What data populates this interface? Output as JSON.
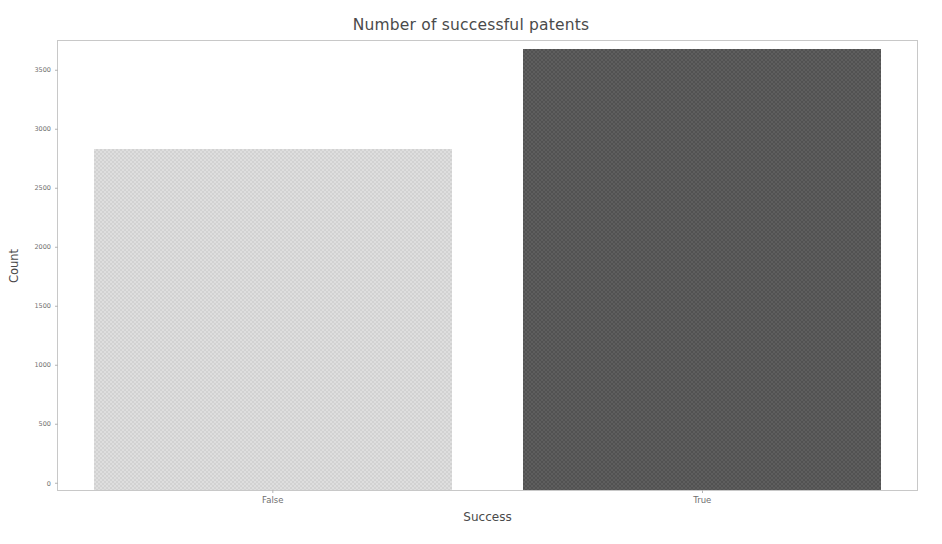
{
  "chart_data": {
    "type": "bar",
    "title": "Number of successful patents",
    "xlabel": "Success",
    "ylabel": "Count",
    "categories": [
      "False",
      "True"
    ],
    "values": [
      2890,
      3730
    ],
    "series": [
      {
        "name": "Count",
        "values": [
          2890,
          3730
        ]
      }
    ],
    "yticks": [
      0,
      500,
      1000,
      1500,
      2000,
      2500,
      3000,
      3500
    ],
    "ytick_labels": [
      "0",
      "500",
      "1000",
      "1500",
      "2000",
      "2500",
      "3000",
      "3500"
    ],
    "ylim": [
      0,
      3800
    ],
    "grid": false,
    "legend": "none",
    "bar_colors": [
      "#dedede",
      "#5e5e5e"
    ],
    "frame_color": "#c8c8c8",
    "text_color": "#4a4a4a",
    "tick_color": "#6f6f6f",
    "background": "#ffffff"
  }
}
